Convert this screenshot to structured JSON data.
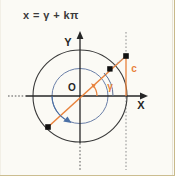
{
  "figure": {
    "formula": "x = γ + kπ",
    "labels": {
      "y_axis": "Y",
      "x_axis": "X",
      "origin": "O",
      "angle": "γ",
      "segment": "c"
    },
    "colors": {
      "background": "#fbfaf5",
      "axis": "#262626",
      "outer_circle": "#3a3a3a",
      "inner_circle": "#6a7fa8",
      "accent_line": "#e8823c",
      "rotation_arrow": "#4a6fa5",
      "point": "#111111",
      "page_edge": "#c8b98a"
    },
    "geometry": {
      "origin": [
        80,
        96
      ],
      "outer_radius": 47,
      "inner_radius": 28,
      "terminal_point": [
        110,
        69
      ],
      "opposite_point": [
        48,
        127
      ],
      "c_top_point": [
        126,
        56
      ],
      "c_foot": [
        126,
        96
      ],
      "angle_degrees": 42
    },
    "elements": [
      "x-axis",
      "y-axis",
      "outer-circle",
      "inner-circle",
      "terminal-ray",
      "angle-arc",
      "rotation-arc",
      "c-segment",
      "dotted-guides"
    ]
  }
}
